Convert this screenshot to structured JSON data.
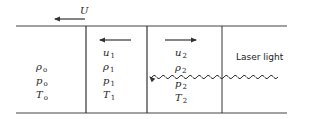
{
  "diagram": {
    "colors": {
      "line": "#333333",
      "text": "#222222"
    },
    "flow_velocity": {
      "symbol": "U",
      "direction": "left"
    },
    "regions": [
      {
        "id": "region-0",
        "density": {
          "symbol": "ρ",
          "sub": "o"
        },
        "pressure": {
          "symbol": "p",
          "sub": "o"
        },
        "temperature": {
          "symbol": "T",
          "sub": "o"
        }
      },
      {
        "id": "region-1",
        "velocity": {
          "symbol": "u",
          "sub": "1",
          "direction": "left"
        },
        "density": {
          "symbol": "ρ",
          "sub": "1"
        },
        "pressure": {
          "symbol": "p",
          "sub": "1"
        },
        "temperature": {
          "symbol": "T",
          "sub": "1"
        }
      },
      {
        "id": "region-2",
        "velocity": {
          "symbol": "u",
          "sub": "2",
          "direction": "right"
        },
        "density": {
          "symbol": "ρ",
          "sub": "2"
        },
        "pressure": {
          "symbol": "p",
          "sub": "2"
        },
        "temperature": {
          "symbol": "T",
          "sub": "2"
        }
      }
    ],
    "laser": {
      "label": "Laser light",
      "direction": "left"
    }
  }
}
